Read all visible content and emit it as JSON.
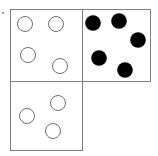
{
  "figure": {
    "description": "Two boxes side by side on the top row and one box below the left box. The top-left and bottom boxes contain open (unfilled) circles; the top-right box contains filled black circles.",
    "canvas": {
      "width": 158,
      "height": 156
    },
    "background_color": "#ffffff",
    "stroke_color": "#808080",
    "stroke_width": 1,
    "open_circle_stroke": "#707070",
    "open_circle_fill": "#ffffff",
    "filled_circle_fill": "#000000"
  },
  "boxes": [
    {
      "id": "box-top-left",
      "name": "top-left-box",
      "counter_style": "open",
      "count": 4,
      "count_label": "4",
      "rect": {
        "x": 10,
        "y": 9,
        "width": 72,
        "height": 72
      },
      "counters": [
        {
          "id": "counter-tl-1",
          "cx": 25,
          "cy": 24,
          "r": 7.5
        },
        {
          "id": "counter-tl-2",
          "cx": 56,
          "cy": 24,
          "r": 7.5
        },
        {
          "id": "counter-tl-3",
          "cx": 28,
          "cy": 55,
          "r": 7.5
        },
        {
          "id": "counter-tl-4",
          "cx": 60,
          "cy": 66,
          "r": 7.5
        }
      ]
    },
    {
      "id": "box-top-right",
      "name": "top-right-box",
      "counter_style": "filled",
      "count": 5,
      "count_label": "5",
      "rect": {
        "x": 82,
        "y": 9,
        "width": 68,
        "height": 72
      },
      "counters": [
        {
          "id": "counter-tr-1",
          "cx": 93,
          "cy": 23,
          "r": 7.8
        },
        {
          "id": "counter-tr-2",
          "cx": 119,
          "cy": 21,
          "r": 7.8
        },
        {
          "id": "counter-tr-3",
          "cx": 138,
          "cy": 40,
          "r": 7.8
        },
        {
          "id": "counter-tr-4",
          "cx": 99,
          "cy": 58,
          "r": 7.8
        },
        {
          "id": "counter-tr-5",
          "cx": 125,
          "cy": 70,
          "r": 7.8
        }
      ]
    },
    {
      "id": "box-bottom-left",
      "name": "bottom-left-box",
      "counter_style": "open",
      "count": 3,
      "count_label": "3",
      "rect": {
        "x": 10,
        "y": 81,
        "width": 72,
        "height": 69
      },
      "counters": [
        {
          "id": "counter-bl-1",
          "cx": 58,
          "cy": 103,
          "r": 7.5
        },
        {
          "id": "counter-bl-2",
          "cx": 27,
          "cy": 116,
          "r": 7.5
        },
        {
          "id": "counter-bl-3",
          "cx": 53,
          "cy": 131,
          "r": 7.5
        }
      ]
    }
  ],
  "marks": [
    {
      "id": "edge-speck",
      "name": "edge-speck-artifact",
      "x": 2,
      "y": 12,
      "size": 2,
      "color": "#9a9a9a"
    }
  ],
  "totals": {
    "open_counters": 7,
    "filled_counters": 5,
    "all_counters": 12
  }
}
